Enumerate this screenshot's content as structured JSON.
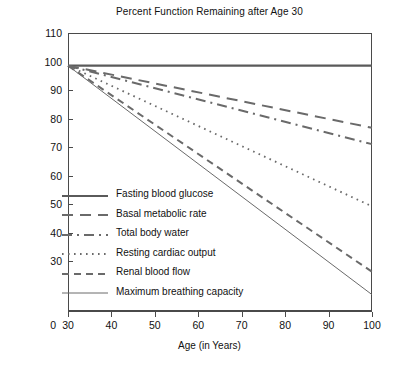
{
  "chart_data": {
    "type": "line",
    "title": "Percent Function Remaining after Age 30",
    "xlabel": "Age (in Years)",
    "ylabel": "",
    "xlim": [
      30,
      100
    ],
    "ylim": [
      25,
      110
    ],
    "grid": false,
    "legend_position": "inside-lower-left",
    "x_ticks": [
      "30",
      "40",
      "50",
      "60",
      "70",
      "80",
      "90",
      "100"
    ],
    "x_tick_values": [
      30,
      40,
      50,
      60,
      70,
      80,
      90,
      100
    ],
    "y_ticks": [
      "110",
      "100",
      "90",
      "80",
      "70",
      "60",
      "50",
      "40",
      "30"
    ],
    "y_tick_values": [
      110,
      100,
      90,
      80,
      70,
      60,
      50,
      40,
      30
    ],
    "y_origin_label": "0",
    "x": [
      30,
      100
    ],
    "series": [
      {
        "name": "Fasting blood glucose",
        "values": [
          100,
          100
        ],
        "style": "solid-thick"
      },
      {
        "name": "Basal metabolic rate",
        "values": [
          100,
          81
        ],
        "style": "long-dash"
      },
      {
        "name": "Total body water",
        "values": [
          100,
          76
        ],
        "style": "dash-dot"
      },
      {
        "name": "Resting cardiac output",
        "values": [
          100,
          57
        ],
        "style": "dotted"
      },
      {
        "name": "Renal blood flow",
        "values": [
          100,
          37
        ],
        "style": "dashed"
      },
      {
        "name": "Maximum breathing capacity",
        "values": [
          100,
          30
        ],
        "style": "solid-thin"
      }
    ]
  }
}
